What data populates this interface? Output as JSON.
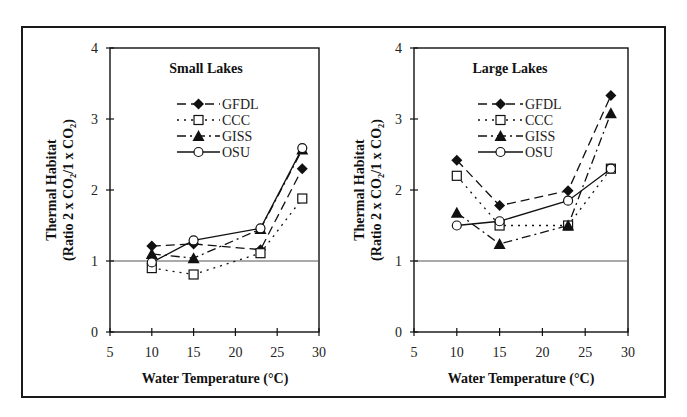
{
  "figure": {
    "xlabel": "Water Temperature (°C)",
    "ylabel_line1": "Thermal Habitat",
    "ylabel_line2": "(Ratio 2 x CO₂/1 x CO₂)"
  },
  "chart_data": [
    {
      "type": "line",
      "title": "Small Lakes",
      "xlabel": "Water Temperature (°C)",
      "ylabel": "Thermal Habitat (Ratio 2 x CO2/1 x CO2)",
      "xlim": [
        5,
        30
      ],
      "ylim": [
        0,
        4
      ],
      "xticks": [
        5,
        10,
        15,
        20,
        25,
        30
      ],
      "yticks": [
        0,
        1,
        2,
        3,
        4
      ],
      "reference_line": 1,
      "grid": false,
      "legend_position": "upper center",
      "x": [
        10,
        15,
        23,
        28
      ],
      "series": [
        {
          "name": "GFDL",
          "marker": "filled-diamond",
          "line": "dashed",
          "values": [
            1.21,
            1.24,
            1.16,
            2.3
          ]
        },
        {
          "name": "CCC",
          "marker": "open-square",
          "line": "dotted",
          "values": [
            0.9,
            0.81,
            1.11,
            1.88
          ]
        },
        {
          "name": "GISS",
          "marker": "filled-triangle",
          "line": "dash-dot",
          "values": [
            1.1,
            1.04,
            1.45,
            2.57
          ]
        },
        {
          "name": "OSU",
          "marker": "open-circle",
          "line": "solid",
          "values": [
            0.98,
            1.29,
            1.46,
            2.59
          ]
        }
      ]
    },
    {
      "type": "line",
      "title": "Large Lakes",
      "xlabel": "Water Temperature (°C)",
      "ylabel": "Thermal Habitat (Ratio 2 x CO2/1 x CO2)",
      "xlim": [
        5,
        30
      ],
      "ylim": [
        0,
        4
      ],
      "xticks": [
        5,
        10,
        15,
        20,
        25,
        30
      ],
      "yticks": [
        0,
        1,
        2,
        3,
        4
      ],
      "reference_line": 1,
      "grid": false,
      "legend_position": "upper center",
      "x": [
        10,
        15,
        23,
        28
      ],
      "series": [
        {
          "name": "GFDL",
          "marker": "filled-diamond",
          "line": "dashed",
          "values": [
            2.42,
            1.78,
            1.99,
            3.33
          ]
        },
        {
          "name": "CCC",
          "marker": "open-square",
          "line": "dotted",
          "values": [
            2.2,
            1.5,
            1.5,
            2.3
          ]
        },
        {
          "name": "GISS",
          "marker": "filled-triangle",
          "line": "dash-dot",
          "values": [
            1.68,
            1.24,
            1.5,
            3.08
          ]
        },
        {
          "name": "OSU",
          "marker": "open-circle",
          "line": "solid",
          "values": [
            1.5,
            1.56,
            1.85,
            2.3
          ]
        }
      ]
    }
  ],
  "colors": {
    "line": "#111111",
    "reference_line": "#555555",
    "frame": "#1a1a1a"
  }
}
